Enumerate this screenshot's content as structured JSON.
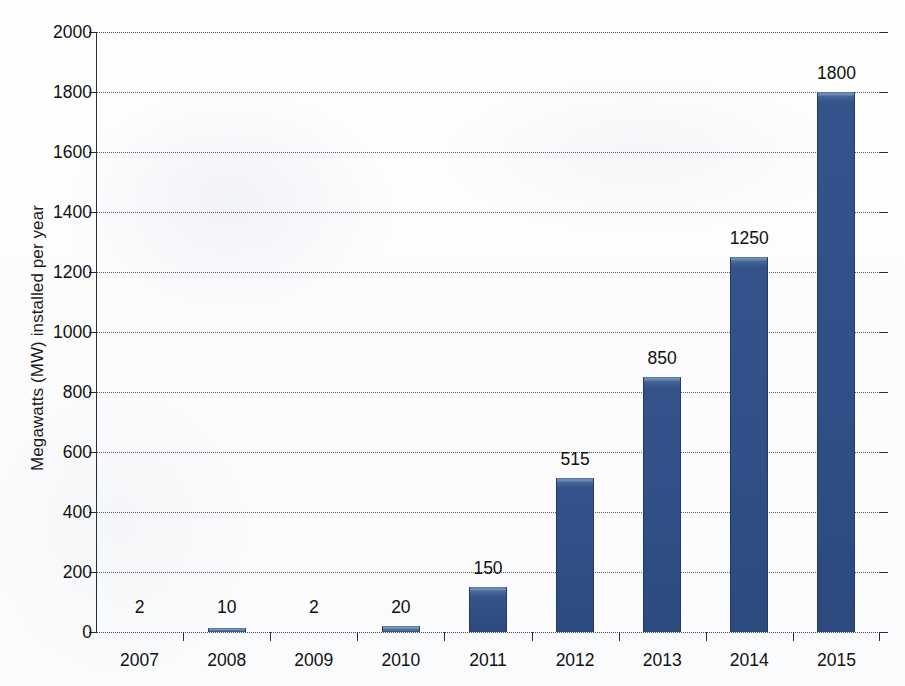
{
  "chart_data": {
    "type": "bar",
    "title": "",
    "xlabel": "",
    "ylabel": "Megawatts (MW) installed per year",
    "categories": [
      "2007",
      "2008",
      "2009",
      "2010",
      "2011",
      "2012",
      "2013",
      "2014",
      "2015"
    ],
    "values": [
      2,
      10,
      2,
      20,
      150,
      515,
      850,
      1250,
      1800
    ],
    "value_labels": [
      "2",
      "10",
      "2",
      "20",
      "150",
      "515",
      "850",
      "1250",
      "1800"
    ],
    "ylim": [
      0,
      2000
    ],
    "y_ticks": [
      0,
      200,
      400,
      600,
      800,
      1000,
      1200,
      1400,
      1600,
      1800,
      2000
    ],
    "y_tick_labels": [
      "0",
      "200",
      "400",
      "600",
      "800",
      "1000",
      "1200",
      "1400",
      "1600",
      "1800",
      "2000"
    ],
    "grid": true,
    "grid_style": "dotted",
    "legend": false,
    "series": [
      {
        "name": "Megawatts installed per year",
        "values": [
          2,
          10,
          2,
          20,
          150,
          515,
          850,
          1250,
          1800
        ]
      }
    ],
    "colors": {
      "bar_fill": "#2F4F86",
      "bar_highlight": "#6D8AB4",
      "bar_edge": "#243A63",
      "axis": "#2A2D31",
      "gridline": "#54585E",
      "text": "#111111",
      "background": "#FFFFFF"
    }
  }
}
